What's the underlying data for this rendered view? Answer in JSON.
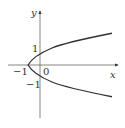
{
  "diagram": {
    "type": "parabola-graph",
    "equation_shape": "x = y^2 - 1",
    "axes": {
      "x_label": "x",
      "y_label": "y",
      "origin_label": "0"
    },
    "tick_labels": {
      "x_neg1": "−1",
      "y_pos1": "1",
      "y_neg1": "−1"
    },
    "colors": {
      "axis": "#555555",
      "curve": "#333333",
      "background": "#ffffff"
    }
  }
}
